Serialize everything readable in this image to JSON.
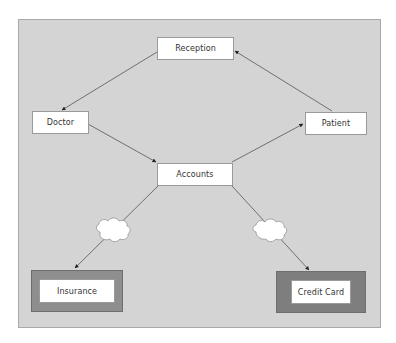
{
  "diagram": {
    "background_color": "#d4d4d4",
    "node_color": "#ffffff",
    "wrapper_colors": {
      "insurance": "#8e8e8e",
      "credit_card": "#7e7e7e"
    },
    "nodes": {
      "reception": {
        "label": "Reception"
      },
      "doctor": {
        "label": "Doctor"
      },
      "patient": {
        "label": "Patient"
      },
      "accounts": {
        "label": "Accounts"
      },
      "insurance": {
        "label": "Insurance"
      },
      "credit_card": {
        "label": "Credit Card"
      }
    },
    "edges": [
      {
        "from": "Reception",
        "to": "Doctor",
        "arrow": "end"
      },
      {
        "from": "Doctor",
        "to": "Accounts",
        "arrow": "end"
      },
      {
        "from": "Accounts",
        "to": "Patient",
        "arrow": "end"
      },
      {
        "from": "Patient",
        "to": "Reception",
        "arrow": "end"
      },
      {
        "from": "Accounts",
        "to": "Insurance",
        "arrow": "end",
        "via": "cloud"
      },
      {
        "from": "Accounts",
        "to": "Credit Card",
        "arrow": "end",
        "via": "cloud"
      }
    ],
    "icons": [
      "cloud-icon",
      "cloud-icon"
    ]
  }
}
